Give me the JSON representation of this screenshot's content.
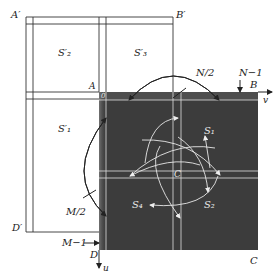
{
  "diagram": {
    "labels": {
      "A_prime": "A′",
      "B_prime": "B′",
      "D_prime": "D′",
      "A": "A",
      "B": "B",
      "C": "C",
      "D": "D",
      "S2_prime": "S′₂",
      "S3_prime": "S′₃",
      "S1_prime": "S′₁",
      "N_half": "N/2",
      "N_minus_1": "N−1",
      "M_half": "M/2",
      "M_minus_1": "M−1",
      "v_axis": "v",
      "u_axis": "u",
      "origin_0": "0",
      "center_C": "C",
      "S1": "S₁",
      "S2": "S₂",
      "S3": "S₃",
      "S4": "S₄"
    },
    "colors": {
      "dark_square": "#3c3c3c",
      "outline": "#333333",
      "white_lines": "#e6e6e6",
      "background": "#ffffff"
    }
  }
}
